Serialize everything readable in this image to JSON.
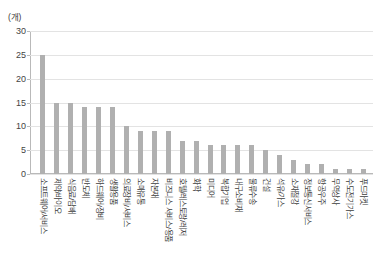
{
  "chart_data": {
    "type": "bar",
    "title": "",
    "subtitle": "",
    "xlabel": "",
    "ylabel": "(개)",
    "unit_label": "(개)",
    "ylim": [
      0,
      30
    ],
    "yticks": [
      0,
      5,
      10,
      15,
      20,
      25,
      30
    ],
    "ytick_labels": [
      "0",
      "5",
      "10",
      "15",
      "20",
      "25",
      "30"
    ],
    "grid": true,
    "legend": "none",
    "bar_color": "#b0b0b0",
    "categories": [
      "소프트웨어/서비스",
      "제약/바이오",
      "식음료/담배",
      "반도체",
      "하드웨어/장비",
      "생활용품",
      "의료장비/서비스",
      "소매유통",
      "자본재",
      "비즈니스 서비스/용품",
      "호텔/레스토랑/레저",
      "화학",
      "미디어",
      "복합기업",
      "내구소비재",
      "물류수송",
      "건설",
      "석유/가스",
      "소재철강",
      "정보통신서비스",
      "항공우주",
      "무역상사",
      "수도전기가스",
      "푸드마켓"
    ],
    "values": [
      25,
      15,
      15,
      14,
      14,
      14,
      10,
      9,
      9,
      9,
      7,
      7,
      6,
      6,
      6,
      6,
      5,
      4,
      3,
      2,
      2,
      1,
      1,
      1
    ]
  }
}
